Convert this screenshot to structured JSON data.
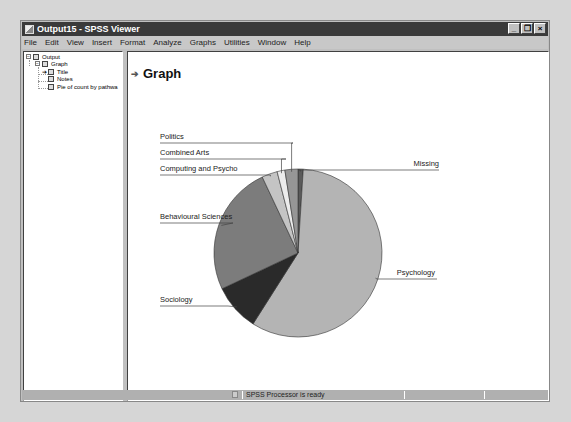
{
  "window": {
    "title": "Output15 - SPSS Viewer",
    "controls": [
      "_",
      "❐",
      "×"
    ]
  },
  "menubar": {
    "items": [
      "File",
      "Edit",
      "View",
      "Insert",
      "Format",
      "Analyze",
      "Graphs",
      "Utilities",
      "Window",
      "Help"
    ]
  },
  "outline": {
    "nodes": [
      {
        "label": "Output",
        "level": 0,
        "expander": "−"
      },
      {
        "label": "Graph",
        "level": 1,
        "expander": "−"
      },
      {
        "label": "Title",
        "level": 2,
        "selected_arrow": true
      },
      {
        "label": "Notes",
        "level": 2
      },
      {
        "label": "Pie of count by pathwa",
        "level": 2
      }
    ]
  },
  "content": {
    "heading": "Graph",
    "heading_arrow": "➔"
  },
  "chart_data": {
    "type": "pie",
    "title": "",
    "start_angle_deg": 0,
    "direction": "clockwise",
    "slices": [
      {
        "label": "Missing",
        "value": 1.0,
        "color": "#5a5a5a"
      },
      {
        "label": "Psychology",
        "value": 58.0,
        "color": "#b4b4b4"
      },
      {
        "label": "Sociology",
        "value": 9.0,
        "color": "#2a2a2a"
      },
      {
        "label": "Behavioural Sciences",
        "value": 25.0,
        "color": "#7c7c7c"
      },
      {
        "label": "Computing and Psycho",
        "value": 3.0,
        "color": "#c4c4c4"
      },
      {
        "label": "Combined Arts",
        "value": 1.5,
        "color": "#ececec"
      },
      {
        "label": "Politics",
        "value": 2.5,
        "color": "#969696"
      }
    ],
    "legend": "leader-line labels"
  },
  "status": {
    "text": "SPSS Processor  is ready"
  }
}
